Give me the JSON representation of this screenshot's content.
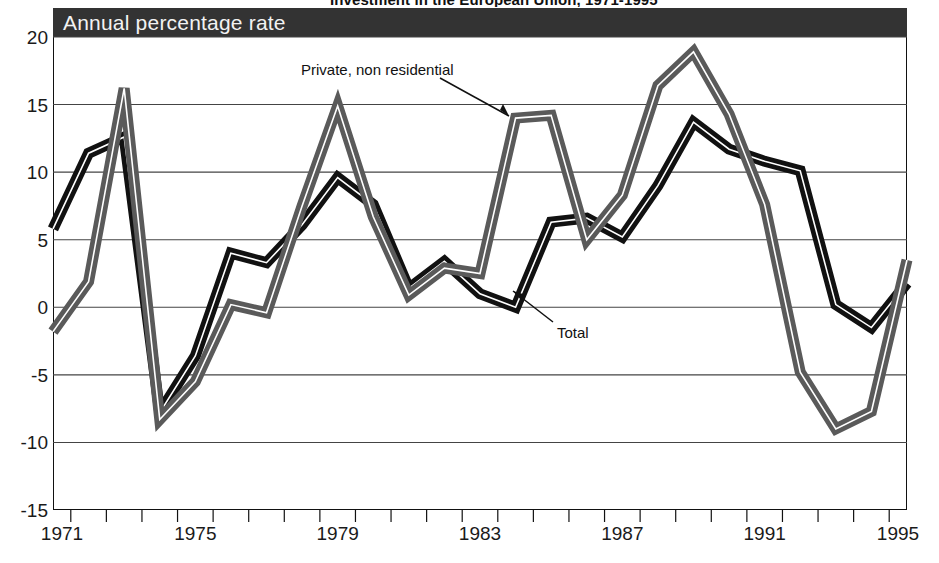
{
  "page": {
    "clipped_header_text": "Investment in the European Union, 1971-1995",
    "banner_label": "Annual percentage rate"
  },
  "axes": {
    "y_ticks": [
      "20",
      "15",
      "10",
      "5",
      "0",
      "-5",
      "-10",
      "-15"
    ],
    "x_ticks": [
      "1971",
      "1975",
      "1979",
      "1983",
      "1987",
      "1991",
      "1995"
    ]
  },
  "annotations": {
    "private": "Private, non residential",
    "total": "Total"
  },
  "colors": {
    "banner_bg": "#333333",
    "banner_text": "#f2f2f2",
    "total_band": "#111111",
    "private_band": "#5a5a5a",
    "band_center": "#ffffff",
    "gridline": "#444444",
    "axis": "#111111"
  },
  "chart_data": {
    "type": "line",
    "title": "Annual percentage rate",
    "xlabel": "",
    "ylabel": "Annual percentage rate",
    "xlim": [
      1971,
      1995
    ],
    "ylim": [
      -15,
      20
    ],
    "y_ticks": [
      20,
      15,
      10,
      5,
      0,
      -5,
      -10,
      -15
    ],
    "x_tick_labels": [
      1971,
      1975,
      1979,
      1983,
      1987,
      1991,
      1995
    ],
    "x_tick_step_minor": 1,
    "grid": "horizontal",
    "legend": "annotations-with-arrows",
    "x": [
      1971,
      1972,
      1973,
      1974,
      1975,
      1976,
      1977,
      1978,
      1979,
      1980,
      1981,
      1982,
      1983,
      1984,
      1985,
      1986,
      1987,
      1988,
      1989,
      1990,
      1991,
      1992,
      1993,
      1994,
      1995
    ],
    "series": [
      {
        "name": "Total",
        "style": "solid-black-band",
        "values": [
          5.8,
          11.4,
          12.6,
          -7.8,
          -3.6,
          4.0,
          3.3,
          6.1,
          9.6,
          7.6,
          1.4,
          3.4,
          1.0,
          0.0,
          6.3,
          6.6,
          5.2,
          9.0,
          13.7,
          11.7,
          10.8,
          10.1,
          0.2,
          -1.5,
          1.8
        ]
      },
      {
        "name": "Private, non residential",
        "style": "gray-band-white-core",
        "values": [
          -1.8,
          1.9,
          16.2,
          -8.3,
          -5.5,
          0.2,
          -0.4,
          7.5,
          14.9,
          6.7,
          0.9,
          2.9,
          2.5,
          14.0,
          14.2,
          5.0,
          8.3,
          16.4,
          18.9,
          14.3,
          7.6,
          -4.8,
          -9.0,
          -7.7,
          3.5
        ]
      }
    ]
  }
}
